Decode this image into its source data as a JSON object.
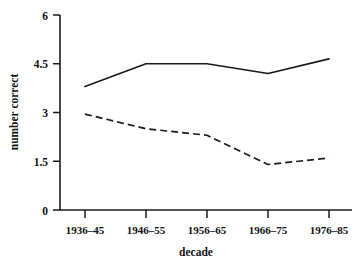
{
  "chart_data": {
    "type": "line",
    "title": "",
    "xlabel": "decade",
    "ylabel": "number correct",
    "categories": [
      "1936–45",
      "1946–55",
      "1956–65",
      "1966–75",
      "1976–85"
    ],
    "ylim": [
      0,
      6
    ],
    "yticks": [
      0,
      1.5,
      3,
      4.5,
      6
    ],
    "ytick_labels": [
      "0",
      "1.5",
      "3",
      "4.5",
      "6"
    ],
    "grid": false,
    "legend": "none",
    "series": [
      {
        "name": "solid-line",
        "style": "solid",
        "color": "#1a1a1a",
        "values": [
          3.8,
          4.5,
          4.5,
          4.2,
          4.65
        ]
      },
      {
        "name": "dashed-line",
        "style": "dashed",
        "color": "#1a1a1a",
        "values": [
          2.95,
          2.5,
          2.3,
          1.4,
          1.6
        ]
      }
    ]
  },
  "axes": {
    "y_axis_title": "number correct",
    "x_axis_title": "decade"
  }
}
